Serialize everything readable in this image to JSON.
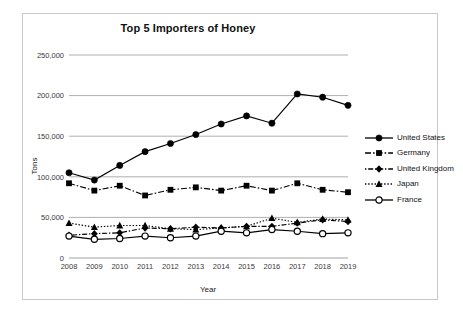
{
  "chart_data": {
    "type": "line",
    "title": "Top 5 Importers of Honey",
    "xlabel": "Year",
    "ylabel": "Tons",
    "categories": [
      "2008",
      "2009",
      "2010",
      "2011",
      "2012",
      "2013",
      "2014",
      "2015",
      "2016",
      "2017",
      "2018",
      "2019"
    ],
    "ylim": [
      0,
      250000
    ],
    "ytick_labels": [
      "0",
      "50,000",
      "100,000",
      "150,000",
      "200,000",
      "250,000"
    ],
    "ytick_values": [
      0,
      50000,
      100000,
      150000,
      200000,
      250000
    ],
    "grid": "horizontal",
    "legend_position": "right",
    "series": [
      {
        "name": "United States",
        "marker": "filled-circle",
        "line_style": "solid",
        "values": [
          105000,
          96000,
          114000,
          131000,
          141000,
          152000,
          165000,
          175000,
          166000,
          202000,
          198000,
          188000
        ]
      },
      {
        "name": "Germany",
        "marker": "filled-square",
        "line_style": "dash-dot",
        "values": [
          92000,
          83000,
          89000,
          77000,
          84000,
          87000,
          83000,
          89000,
          83000,
          92000,
          84000,
          81000
        ]
      },
      {
        "name": "United Kingdom",
        "marker": "filled-diamond",
        "line_style": "dot-dash",
        "values": [
          28000,
          30000,
          31000,
          37000,
          36000,
          38000,
          37000,
          39000,
          39000,
          43000,
          47000,
          45000
        ]
      },
      {
        "name": "Japan",
        "marker": "filled-triangle",
        "line_style": "dotted",
        "values": [
          43000,
          38000,
          40000,
          40000,
          36000,
          35000,
          37000,
          39000,
          49000,
          44000,
          48000,
          47000
        ]
      },
      {
        "name": "France",
        "marker": "open-circle",
        "line_style": "solid",
        "values": [
          27000,
          23000,
          24000,
          27000,
          25000,
          27000,
          33000,
          31000,
          35000,
          33000,
          30000,
          31000
        ]
      }
    ]
  },
  "legend": {
    "items": [
      {
        "label": "United States"
      },
      {
        "label": "Germany"
      },
      {
        "label": "United Kingdom"
      },
      {
        "label": "Japan"
      },
      {
        "label": "France"
      }
    ]
  }
}
